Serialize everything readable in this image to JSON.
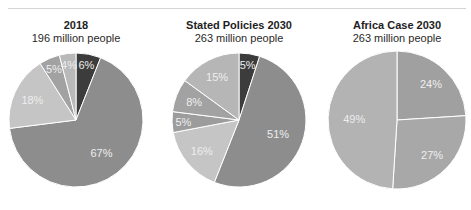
{
  "chart_data": [
    {
      "type": "pie",
      "title": "2018",
      "subtitle": "196 million people",
      "slices": [
        {
          "label": "6%",
          "value": 6,
          "color": "#3c3c3c"
        },
        {
          "label": "67%",
          "value": 67,
          "color": "#8d8d8d"
        },
        {
          "label": "18%",
          "value": 18,
          "color": "#c5c5c5"
        },
        {
          "label": "5%",
          "value": 5,
          "color": "#a2a2a2"
        },
        {
          "label": "4%",
          "value": 4,
          "color": "#b9b9b9"
        }
      ]
    },
    {
      "type": "pie",
      "title": "Stated Policies 2030",
      "subtitle": "263 million people",
      "slices": [
        {
          "label": "5%",
          "value": 5,
          "color": "#3c3c3c"
        },
        {
          "label": "51%",
          "value": 51,
          "color": "#8d8d8d"
        },
        {
          "label": "16%",
          "value": 16,
          "color": "#c5c5c5"
        },
        {
          "label": "5%",
          "value": 5,
          "color": "#9c9c9c"
        },
        {
          "label": "8%",
          "value": 8,
          "color": "#a2a2a2"
        },
        {
          "label": "15%",
          "value": 15,
          "color": "#b6b6b6"
        }
      ]
    },
    {
      "type": "pie",
      "title": "Africa Case 2030",
      "subtitle": "263 million people",
      "slices": [
        {
          "label": "24%",
          "value": 24,
          "color": "#a0a0a0"
        },
        {
          "label": "27%",
          "value": 27,
          "color": "#a8a8a8"
        },
        {
          "label": "49%",
          "value": 49,
          "color": "#b3b3b3"
        }
      ]
    }
  ]
}
